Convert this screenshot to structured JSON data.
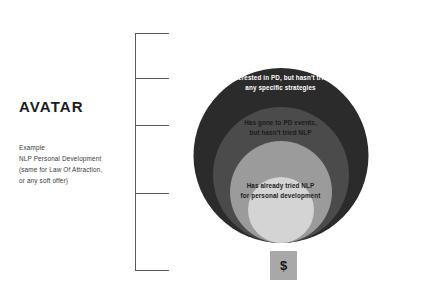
{
  "avatar": {
    "title": "AVATAR",
    "description_lines": [
      "Example",
      "NLP Personal Development",
      "(same for Law Of Attraction,",
      "or any soft offer)"
    ]
  },
  "bracket": {
    "tick_count": 5,
    "tick_positions_px": [
      0,
      45,
      92,
      160,
      237
    ]
  },
  "diagram": {
    "type": "nested-circles",
    "rings": [
      {
        "level": 1,
        "color": "#2b2b2b",
        "text_color": "#ffffff",
        "lines": [
          "Curious about personal development"
        ]
      },
      {
        "level": 2,
        "color": "#4b4b4c",
        "text_color": "#ffffff",
        "lines": [
          "Interested in PD, but hasn't tried",
          "any specific strategies"
        ]
      },
      {
        "level": 3,
        "color": "#9b9b9b",
        "text_color": "#1b1b1b",
        "lines": [
          "Has gone to PD events,",
          "but hasn't tried NLP"
        ]
      },
      {
        "level": 4,
        "color": "#d4d4d4",
        "text_color": "#1b1b1b",
        "lines": [
          "Has already tried NLP",
          "for personal development"
        ]
      }
    ]
  },
  "money": {
    "icon": "dollar-sign-icon",
    "symbol": "$",
    "box_color": "#a8a8a8"
  }
}
